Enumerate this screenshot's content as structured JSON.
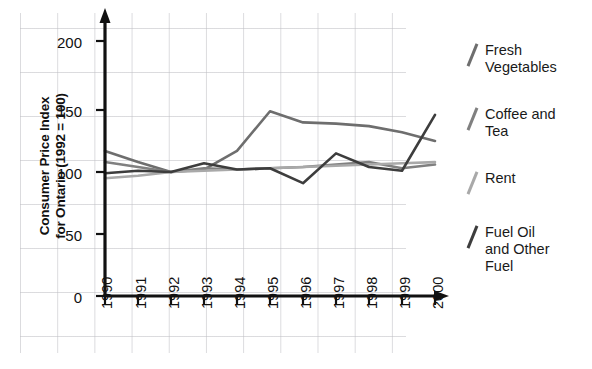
{
  "chart_data": {
    "type": "line",
    "title": "",
    "xlabel": "",
    "ylabel": "Consumer Price Index for Ontario (1992 = 100)",
    "ylabel_line1": "Consumer Price Index",
    "ylabel_line2": "for Ontario (1992 = 100)",
    "x": [
      1990,
      1991,
      1992,
      1993,
      1994,
      1995,
      1996,
      1997,
      1998,
      1999,
      2000
    ],
    "categories": [
      "1990",
      "1991",
      "1992",
      "1993",
      "1994",
      "1995",
      "1996",
      "1997",
      "1998",
      "1999",
      "2000"
    ],
    "ylim": [
      0,
      215
    ],
    "xlim": [
      1990,
      2000
    ],
    "yticks": [
      0,
      50,
      100,
      150,
      200
    ],
    "ytick_labels": [
      "0",
      "50",
      "100",
      "150",
      "200"
    ],
    "grid": true,
    "legend_position": "right",
    "series": [
      {
        "name": "Fresh Vegetables",
        "color": "#6e6e6e",
        "values": [
          117,
          108,
          100,
          102,
          117,
          149,
          140,
          139,
          137,
          132,
          125
        ]
      },
      {
        "name": "Coffee and Tea",
        "color": "#808080",
        "values": [
          108,
          104,
          100,
          103,
          102,
          103,
          104,
          106,
          108,
          103,
          106
        ]
      },
      {
        "name": "Rent",
        "color": "#a9a9a9",
        "values": [
          95,
          97,
          100,
          101,
          102,
          103,
          104,
          105,
          106,
          107,
          108
        ]
      },
      {
        "name": "Fuel Oil and Other Fuel",
        "color": "#3d3d3d",
        "values": [
          99,
          101,
          100,
          107,
          102,
          103,
          91,
          115,
          104,
          101,
          146
        ]
      }
    ]
  },
  "axis": {
    "ytick_labels": [
      "200",
      "150",
      "100",
      "50",
      "0"
    ],
    "xtick_labels": [
      "1990",
      "1991",
      "1992",
      "1993",
      "1994",
      "1995",
      "1996",
      "1997",
      "1998",
      "1999",
      "2000"
    ]
  },
  "legend": {
    "items": [
      {
        "label": "Fresh\nVegetables",
        "color": "#6e6e6e"
      },
      {
        "label": "Coffee and\nTea",
        "color": "#808080"
      },
      {
        "label": "Rent",
        "color": "#a9a9a9"
      },
      {
        "label": "Fuel Oil\nand Other\nFuel",
        "color": "#3d3d3d"
      }
    ]
  }
}
